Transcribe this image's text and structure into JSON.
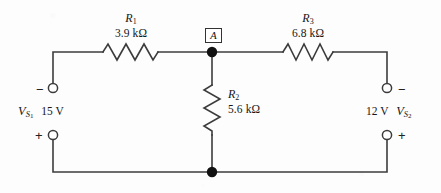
{
  "diagram": {
    "background_color": "#fdfdfd",
    "wire_color": "#3c3c3c",
    "node_label": "A",
    "resistors": [
      {
        "id": "R1",
        "name": "R",
        "subscript": "1",
        "value": "3.9 kΩ",
        "orientation": "horizontal"
      },
      {
        "id": "R2",
        "name": "R",
        "subscript": "2",
        "value": "5.6 kΩ",
        "orientation": "vertical"
      },
      {
        "id": "R3",
        "name": "R",
        "subscript": "3",
        "value": "6.8 kΩ",
        "orientation": "horizontal"
      }
    ],
    "sources": [
      {
        "id": "VS1",
        "name": "V",
        "subscript": "S",
        "sub_subscript": "1",
        "value": "15 V",
        "side": "left",
        "top_polarity": "−",
        "bottom_polarity": "+"
      },
      {
        "id": "VS2",
        "name": "V",
        "subscript": "S",
        "sub_subscript": "2",
        "value": "12 V",
        "side": "right",
        "top_polarity": "−",
        "bottom_polarity": "+"
      }
    ],
    "junction_dots": [
      {
        "name": "node-a-junction",
        "x": 212,
        "y": 52
      },
      {
        "name": "ground-junction",
        "x": 212,
        "y": 172
      }
    ],
    "terminals": [
      {
        "name": "vs1-negative-terminal",
        "x": 53,
        "y": 88
      },
      {
        "name": "vs1-positive-terminal",
        "x": 53,
        "y": 135
      },
      {
        "name": "vs2-negative-terminal",
        "x": 387,
        "y": 88
      },
      {
        "name": "vs2-positive-terminal",
        "x": 387,
        "y": 135
      }
    ]
  }
}
